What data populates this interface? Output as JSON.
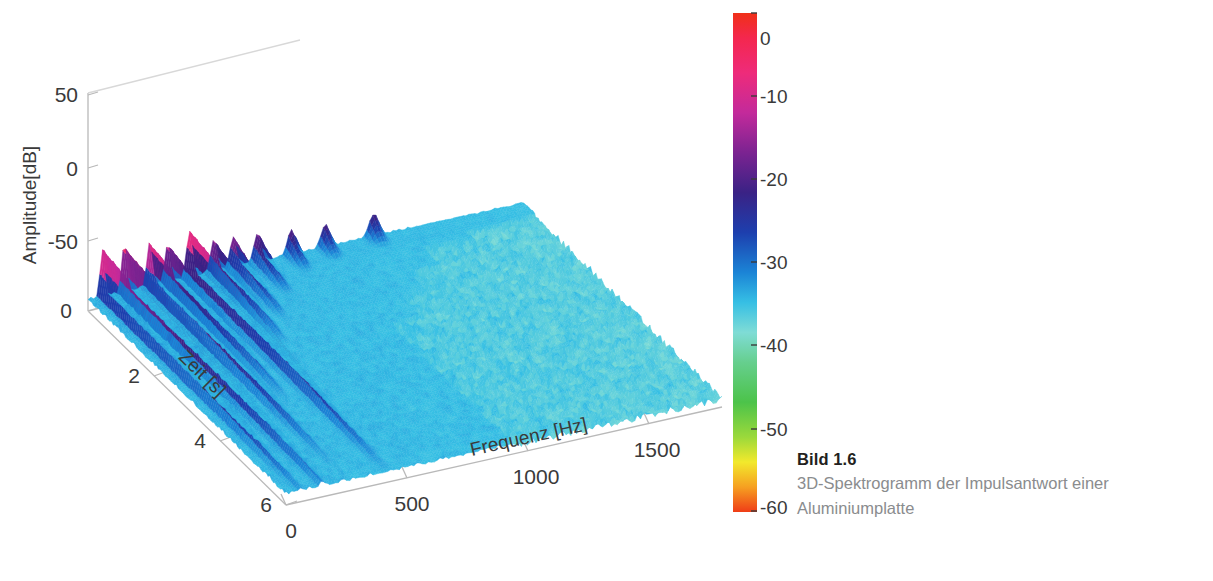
{
  "figure": {
    "background_color": "#ffffff",
    "axis_line_color": "#b9b9b9",
    "tick_text_color": "#3a3a3a"
  },
  "caption": {
    "number_label": "Bild 1.6",
    "text_line1": "3D-Spektrogramm der Impulsantwort einer",
    "text_line2": "Aluminiumplatte",
    "title_color": "#231f20",
    "body_color": "#8a8c8e"
  },
  "colorbar": {
    "min": -60,
    "max": 0,
    "unit": "dB",
    "ticks": [
      "0",
      "-10",
      "-20",
      "-30",
      "-40",
      "-50",
      "-60"
    ],
    "tick_values": [
      0,
      -10,
      -20,
      -30,
      -40,
      -50,
      -60
    ],
    "colormap_name": "hsv-like",
    "stops": [
      {
        "pos": 0.0,
        "color": "#f03018"
      },
      {
        "pos": 0.05,
        "color": "#f4274e"
      },
      {
        "pos": 0.12,
        "color": "#ee2b7a"
      },
      {
        "pos": 0.2,
        "color": "#c32a9b"
      },
      {
        "pos": 0.28,
        "color": "#7b2391"
      },
      {
        "pos": 0.36,
        "color": "#3a2285"
      },
      {
        "pos": 0.44,
        "color": "#1d3fae"
      },
      {
        "pos": 0.52,
        "color": "#1b84d6"
      },
      {
        "pos": 0.58,
        "color": "#36bfe4"
      },
      {
        "pos": 0.64,
        "color": "#7fdcd6"
      },
      {
        "pos": 0.7,
        "color": "#66cf8e"
      },
      {
        "pos": 0.78,
        "color": "#4cc34a"
      },
      {
        "pos": 0.85,
        "color": "#9bd93b"
      },
      {
        "pos": 0.9,
        "color": "#f2e92c"
      },
      {
        "pos": 0.95,
        "color": "#f6a021"
      },
      {
        "pos": 1.0,
        "color": "#ef3d17"
      }
    ]
  },
  "chart_data": {
    "type": "surface3d",
    "title": "",
    "subtitle": "",
    "xlabel": "Frequenz [Hz]",
    "ylabel": "Zeit [s]",
    "zlabel": "Amplitude[dB]",
    "colorbar_label": "",
    "grid": false,
    "legend_position": "right-colorbar",
    "x_ticks": [
      "0",
      "500",
      "1000",
      "1500"
    ],
    "x_tick_values": [
      0,
      500,
      1000,
      1500
    ],
    "xlim": [
      0,
      1800
    ],
    "y_ticks": [
      "0",
      "2",
      "4",
      "6"
    ],
    "y_tick_values": [
      0,
      2,
      4,
      6
    ],
    "ylim": [
      0,
      7
    ],
    "z_ticks": [
      "50",
      "0",
      "-50"
    ],
    "z_tick_values": [
      50,
      0,
      -50
    ],
    "zlim": [
      -80,
      50
    ],
    "color_scale": [
      -60,
      0
    ],
    "noise_floor_db": -35,
    "ridges": [
      {
        "frequency_hz": 60,
        "peak_db": -2,
        "decay_s": 6.0
      },
      {
        "frequency_hz": 150,
        "peak_db": -1,
        "decay_s": 6.0
      },
      {
        "frequency_hz": 255,
        "peak_db": -4,
        "decay_s": 5.5
      },
      {
        "frequency_hz": 330,
        "peak_db": -8,
        "decay_s": 4.2
      },
      {
        "frequency_hz": 420,
        "peak_db": -3,
        "decay_s": 5.8
      },
      {
        "frequency_hz": 520,
        "peak_db": -12,
        "decay_s": 3.0
      },
      {
        "frequency_hz": 600,
        "peak_db": -14,
        "decay_s": 2.4
      },
      {
        "frequency_hz": 700,
        "peak_db": -15,
        "decay_s": 1.6
      },
      {
        "frequency_hz": 840,
        "peak_db": -18,
        "decay_s": 1.0
      },
      {
        "frequency_hz": 980,
        "peak_db": -19,
        "decay_s": 0.8
      },
      {
        "frequency_hz": 1180,
        "peak_db": -20,
        "decay_s": 0.7
      }
    ]
  }
}
